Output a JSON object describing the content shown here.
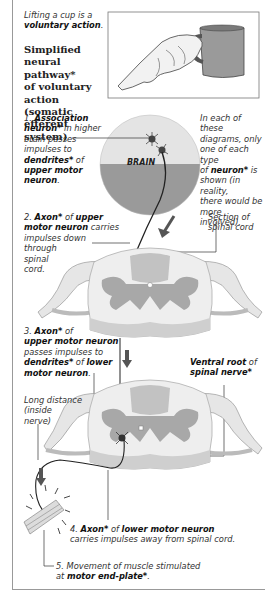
{
  "intro": {
    "line1": "Lifting a cup is a",
    "line2_bold": "voluntary action",
    "line2_end": "."
  },
  "title": {
    "lines": [
      "Simplified",
      "neural pathway*",
      "of voluntary",
      "action (somatic",
      "efferent system)"
    ]
  },
  "illustrations": {
    "hand_cup": "hand-lifting-cup-illustration",
    "brain_label": "BRAIN"
  },
  "note": {
    "lines": [
      "In each of these",
      "diagrams, only",
      "one of each type"
    ],
    "line4_pre": "of ",
    "line4_bold": "neuron*",
    "line4_post": " is",
    "lines_rest": [
      "shown (in reality,",
      "there would be",
      "more involved)."
    ]
  },
  "step1": {
    "num": "1. ",
    "b1": "Association",
    "b2": "neuron*",
    "t2": " in higher",
    "t3": "brain passes",
    "t4": "impulses to",
    "b5": "dendrites*",
    "t5": " of",
    "b6": "upper motor",
    "b7": "neuron",
    "t7": "."
  },
  "step2": {
    "num": "2. ",
    "b1": "Axon*",
    "t1": " of ",
    "b1b": "upper",
    "b2": "motor neuron",
    "t2": " carries",
    "t3": "impulses down",
    "t4": "through",
    "t5": "spinal",
    "t6": "cord."
  },
  "section_label": {
    "line1": "Section of",
    "line2": "spinal cord"
  },
  "step3": {
    "num": "3. ",
    "b1": "Axon*",
    "t1": " of",
    "b2": "upper motor neuron",
    "t3": "passes impulses to",
    "b4": "dendrites*",
    "t4": " of ",
    "b4b": "lower",
    "b5": "motor neuron",
    "t5": "."
  },
  "ventral": {
    "b1": "Ventral root",
    "t1": " of",
    "b2": "spinal nerve*"
  },
  "long_distance": {
    "lines": [
      "Long distance",
      "(inside",
      "nerve)"
    ]
  },
  "step4": {
    "num": "4. ",
    "b1": "Axon*",
    "t1": " of ",
    "b1b": "lower motor neuron",
    "t2": "carries impulses away from spinal cord."
  },
  "step5": {
    "t1": "5. Movement of muscle stimulated",
    "t2": "at ",
    "b2": "motor end-plate*",
    "t2end": "."
  },
  "colors": {
    "brain_top": "#e4e4e4",
    "brain_bottom": "#9a9a9a",
    "cord_grey": "#a8a8a8",
    "cord_white": "#eeeeee",
    "arrow": "#555555",
    "line": "#333333"
  }
}
